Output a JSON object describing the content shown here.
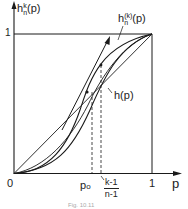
{
  "figure": {
    "y_axis_label": "h",
    "y_axis_label_sup": "k",
    "y_axis_label_sub": "n",
    "y_axis_label_arg": "(p)",
    "y_tick_one": "1",
    "x_axis_label": "p",
    "x_tick_zero": "0",
    "x_tick_one": "1",
    "x_marker_p0": "p",
    "x_marker_p0_sub": "o",
    "x_marker_frac_num": "k-1",
    "x_marker_frac_den": "n-1",
    "curve_label_hnk": "h",
    "curve_label_hnk_sup": "(k)",
    "curve_label_hnk_sub": "n",
    "curve_label_hnk_arg": "(p)",
    "curve_label_h": "h(p)",
    "caption": "Fig. 10.11"
  },
  "colors": {
    "ink": "#1a1a1a",
    "background": "#ffffff"
  }
}
